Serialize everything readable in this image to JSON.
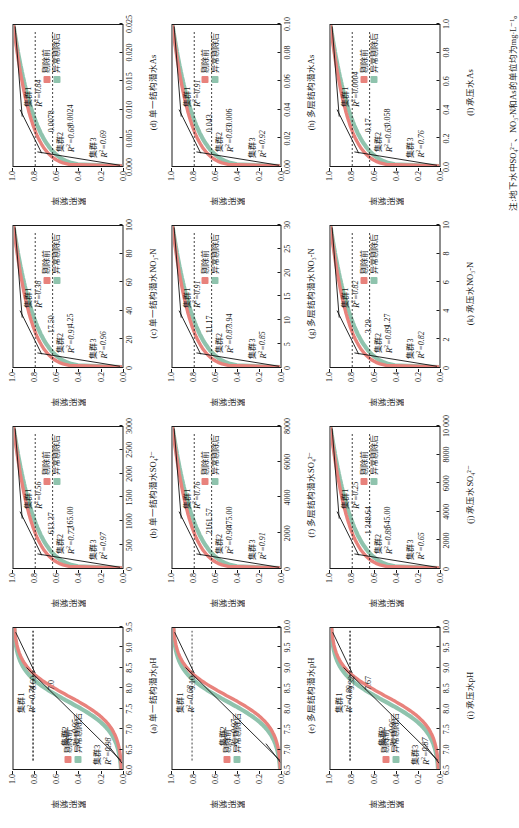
{
  "figure": {
    "y_axis_label": "累积频率",
    "legend": {
      "before_label": "剔除前",
      "after_label": "异常剔除后",
      "before_color": "#e8827c",
      "after_color": "#8fc3ad"
    },
    "cluster_labels": {
      "c1": "集群1",
      "c2": "集群2",
      "c3": "集群3"
    },
    "note": "注:地下水中SO₄²⁻、NO₃-N和As的单位均为mg·L⁻¹。"
  },
  "chart_data": [
    {
      "id": "a",
      "type": "line",
      "caption": "(a) 单一结构潜水pH",
      "xlabel": "pH",
      "ylabel": "累积频率",
      "xlim": [
        6.0,
        9.5
      ],
      "ylim": [
        0.0,
        1.0
      ],
      "xticks": [
        "6.0",
        "6.5",
        "7.0",
        "7.5",
        "8.0",
        "8.5",
        "9.0",
        "9.5"
      ],
      "yticks": [
        "0.0",
        "0.2",
        "0.4",
        "0.6",
        "0.8",
        "1.0"
      ],
      "clusters": [
        {
          "name": "集群1",
          "r2": "0.74",
          "breakpoint": "8.60"
        },
        {
          "name": "集群2",
          "r2": "0.95",
          "breakpoint": "7.0"
        },
        {
          "name": "集群3",
          "r2": "0.98",
          "breakpoint": ""
        }
      ]
    },
    {
      "id": "b",
      "type": "line",
      "caption": "(b) 单一结构潜水SO₄²⁻",
      "xlabel": "SO₄²⁻",
      "ylabel": "累积频率",
      "xlim": [
        0,
        3000
      ],
      "ylim": [
        0.0,
        1.0
      ],
      "xticks": [
        "0",
        "500",
        "1000",
        "1500",
        "2000",
        "2500",
        "3000"
      ],
      "yticks": [
        "0.0",
        "0.2",
        "0.4",
        "0.6",
        "0.8",
        "1.0"
      ],
      "clusters": [
        {
          "name": "集群1",
          "r2": "0.56",
          "breakpoint": "613.37"
        },
        {
          "name": "集群2",
          "r2": "0.72",
          "breakpoint": "165.00"
        },
        {
          "name": "集群3",
          "r2": "0.97",
          "breakpoint": ""
        }
      ]
    },
    {
      "id": "c",
      "type": "line",
      "caption": "(c) 单一结构潜水NO₃-N",
      "xlabel": "NO₃-N",
      "ylabel": "累积频率",
      "xlim": [
        0,
        100
      ],
      "ylim": [
        0.0,
        1.0
      ],
      "xticks": [
        "0",
        "20",
        "40",
        "60",
        "80",
        "100"
      ],
      "yticks": [
        "0.0",
        "0.2",
        "0.4",
        "0.6",
        "0.8",
        "1.0"
      ],
      "clusters": [
        {
          "name": "集群1",
          "r2": "0.38",
          "breakpoint": "17.50"
        },
        {
          "name": "集群2",
          "r2": "0.91",
          "breakpoint": "4.25"
        },
        {
          "name": "集群3",
          "r2": "0.96",
          "breakpoint": ""
        }
      ]
    },
    {
      "id": "d",
      "type": "line",
      "caption": "(d) 单一结构潜水As",
      "xlabel": "As",
      "ylabel": "累积频率",
      "xlim": [
        0.0,
        0.025
      ],
      "ylim": [
        0.0,
        1.0
      ],
      "xticks": [
        "0.000",
        "0.005",
        "0.010",
        "0.015",
        "0.020",
        "0.025"
      ],
      "yticks": [
        "0.0",
        "0.2",
        "0.4",
        "0.6",
        "0.8",
        "1.0"
      ],
      "clusters": [
        {
          "name": "集群1",
          "r2": "0.84",
          "breakpoint": "0.0078"
        },
        {
          "name": "集群2",
          "r2": "0.68",
          "breakpoint": "0.0024"
        },
        {
          "name": "集群3",
          "r2": "0.69",
          "breakpoint": ""
        }
      ]
    },
    {
      "id": "e",
      "type": "line",
      "caption": "(e) 多层结构潜水pH",
      "xlabel": "pH",
      "ylabel": "累积频率",
      "xlim": [
        6.5,
        10.0
      ],
      "ylim": [
        0.0,
        1.0
      ],
      "xticks": [
        "6.5",
        "7.0",
        "7.5",
        "8.0",
        "8.5",
        "9.0",
        "9.5",
        "10.0"
      ],
      "yticks": [
        "0.0",
        "0.2",
        "0.4",
        "0.6",
        "0.8",
        "1.0"
      ],
      "clusters": [
        {
          "name": "集群1",
          "r2": "0.68",
          "breakpoint": "9.10"
        },
        {
          "name": "集群2",
          "r2": "0.97",
          "breakpoint": ""
        }
      ]
    },
    {
      "id": "f",
      "type": "line",
      "caption": "(f) 多层结构潜水SO₄²⁻",
      "xlabel": "SO₄²⁻",
      "ylabel": "累积频率",
      "xlim": [
        0,
        8000
      ],
      "ylim": [
        0.0,
        1.0
      ],
      "xticks": [
        "0",
        "2000",
        "4000",
        "6000",
        "8000"
      ],
      "yticks": [
        "0.0",
        "0.2",
        "0.4",
        "0.6",
        "0.8",
        "1.0"
      ],
      "clusters": [
        {
          "name": "集群1",
          "r2": "0.76",
          "breakpoint": "2161.57"
        },
        {
          "name": "集群2",
          "r2": "0.90",
          "breakpoint": "475.00"
        },
        {
          "name": "集群3",
          "r2": "0.91",
          "breakpoint": ""
        }
      ]
    },
    {
      "id": "g",
      "type": "line",
      "caption": "(g) 多层结构潜水NO₃-N",
      "xlabel": "NO₃-N",
      "ylabel": "累积频率",
      "xlim": [
        0,
        30
      ],
      "ylim": [
        0.0,
        1.0
      ],
      "xticks": [
        "0",
        "5",
        "10",
        "15",
        "20",
        "25",
        "30"
      ],
      "yticks": [
        "0.0",
        "0.2",
        "0.4",
        "0.6",
        "0.8",
        "1.0"
      ],
      "clusters": [
        {
          "name": "集群1",
          "r2": "0.91",
          "breakpoint": "11.17"
        },
        {
          "name": "集群2",
          "r2": "0.87",
          "breakpoint": "3.94"
        },
        {
          "name": "集群3",
          "r2": "0.85",
          "breakpoint": ""
        }
      ]
    },
    {
      "id": "h",
      "type": "line",
      "caption": "(h) 多层结构潜水As",
      "xlabel": "As",
      "ylabel": "累积频率",
      "xlim": [
        0.0,
        0.1
      ],
      "ylim": [
        0.0,
        1.0
      ],
      "xticks": [
        "0.00",
        "0.02",
        "0.04",
        "0.06",
        "0.08",
        "0.10"
      ],
      "yticks": [
        "0.0",
        "0.2",
        "0.4",
        "0.6",
        "0.8",
        "1.0"
      ],
      "clusters": [
        {
          "name": "集群1",
          "r2": "0.91",
          "breakpoint": "0.043"
        },
        {
          "name": "集群2",
          "r2": "0.83",
          "breakpoint": "0.006"
        },
        {
          "name": "集群3",
          "r2": "0.92",
          "breakpoint": ""
        }
      ]
    },
    {
      "id": "i",
      "type": "line",
      "caption": "(i) 承压水pH",
      "xlabel": "pH",
      "ylabel": "累积频率",
      "xlim": [
        6.5,
        10.0
      ],
      "ylim": [
        0.0,
        1.0
      ],
      "xticks": [
        "6.5",
        "7.0",
        "7.5",
        "8.0",
        "8.5",
        "9.0",
        "9.5",
        "10.0"
      ],
      "yticks": [
        "0.0",
        "0.2",
        "0.4",
        "0.6",
        "0.8",
        "1.0"
      ],
      "clusters": [
        {
          "name": "集群1",
          "r2": "0.89",
          "breakpoint": "9.32"
        },
        {
          "name": "集群2",
          "r2": "0.96",
          "breakpoint": "7.67"
        },
        {
          "name": "集群3",
          "r2": "0.87",
          "breakpoint": ""
        }
      ]
    },
    {
      "id": "j",
      "type": "line",
      "caption": "(j) 承压水SO₄²⁻",
      "xlabel": "SO₄²⁻",
      "ylabel": "累积频率",
      "xlim": [
        0,
        10000
      ],
      "ylim": [
        0.0,
        1.0
      ],
      "xticks": [
        "0",
        "2000",
        "4000",
        "6000",
        "8000",
        "10 000"
      ],
      "yticks": [
        "0.0",
        "0.2",
        "0.4",
        "0.6",
        "0.8",
        "1.0"
      ],
      "clusters": [
        {
          "name": "集群1",
          "r2": "0.25",
          "breakpoint": "1 348.64"
        },
        {
          "name": "集群2",
          "r2": "0.88",
          "breakpoint": "545.00"
        },
        {
          "name": "集群3",
          "r2": "0.65",
          "breakpoint": ""
        }
      ]
    },
    {
      "id": "k",
      "type": "line",
      "caption": "(k) 承压水NO₃-N",
      "xlabel": "NO₃-N",
      "ylabel": "累积频率",
      "xlim": [
        0,
        10
      ],
      "ylim": [
        0.0,
        1.0
      ],
      "xticks": [
        "0",
        "2",
        "4",
        "6",
        "8",
        "10"
      ],
      "yticks": [
        "0.0",
        "0.2",
        "0.4",
        "0.6",
        "0.8",
        "1.0"
      ],
      "clusters": [
        {
          "name": "集群1",
          "r2": "0.82",
          "breakpoint": "3.29"
        },
        {
          "name": "集群2",
          "r2": "0.89",
          "breakpoint": "1.27"
        },
        {
          "name": "集群3",
          "r2": "0.82",
          "breakpoint": ""
        }
      ]
    },
    {
      "id": "l",
      "type": "line",
      "caption": "(l) 承压水As",
      "xlabel": "As",
      "ylabel": "累积频率",
      "xlim": [
        0.0,
        1.0
      ],
      "ylim": [
        0.0,
        1.0
      ],
      "xticks": [
        "0.0",
        "0.2",
        "0.4",
        "0.6",
        "0.8",
        "1.0"
      ],
      "yticks": [
        "0.0",
        "0.2",
        "0.4",
        "0.6",
        "0.8",
        "1.0"
      ],
      "clusters": [
        {
          "name": "集群1",
          "r2": "0.0004",
          "breakpoint": "0.17"
        },
        {
          "name": "集群2",
          "r2": "0.65",
          "breakpoint": "0.058"
        },
        {
          "name": "集群3",
          "r2": "0.76",
          "breakpoint": ""
        }
      ]
    }
  ]
}
